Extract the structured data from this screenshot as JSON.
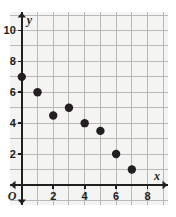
{
  "chart_data": {
    "type": "scatter",
    "title": "",
    "xlabel": "x",
    "ylabel": "y",
    "xlim": [
      -0.75,
      9.3
    ],
    "ylim": [
      -1.3,
      11.2
    ],
    "grid": true,
    "grid_step_x": 1,
    "grid_step_y": 1,
    "legend": false,
    "origin_label": "O",
    "xticks": [
      2,
      4,
      6,
      8
    ],
    "xtick_labels": [
      "2",
      "4",
      "6",
      "8"
    ],
    "yticks": [
      2,
      4,
      6,
      8,
      10
    ],
    "ytick_labels": [
      "2",
      "4",
      "6",
      "8",
      "10"
    ],
    "points": [
      {
        "x": 0,
        "y": 7
      },
      {
        "x": 1,
        "y": 6
      },
      {
        "x": 2,
        "y": 4.5
      },
      {
        "x": 3,
        "y": 5
      },
      {
        "x": 4,
        "y": 4
      },
      {
        "x": 5,
        "y": 3.5
      },
      {
        "x": 6,
        "y": 2
      },
      {
        "x": 7,
        "y": 1
      }
    ],
    "point_color": "#231f20",
    "point_radius": 4.2,
    "axis_color": "#231f20",
    "grid_color": "#b9b9b7",
    "panel_color": "#f4f4f3"
  }
}
